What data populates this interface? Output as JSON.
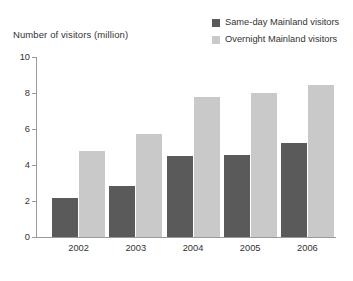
{
  "chart_data": {
    "type": "bar",
    "title": "Number of visitors (million)",
    "xlabel": "",
    "ylabel": "Number of visitors (million)",
    "categories": [
      "2002",
      "2003",
      "2004",
      "2005",
      "2006"
    ],
    "series": [
      {
        "name": "Same-day Mainland visitors",
        "color": "#5a5a5a",
        "values": [
          2.15,
          2.85,
          4.5,
          4.55,
          5.2
        ]
      },
      {
        "name": "Overnight Mainland visitors",
        "color": "#c9c9c9",
        "values": [
          4.8,
          5.7,
          7.8,
          8.0,
          8.45
        ]
      }
    ],
    "ylim": [
      0,
      10
    ],
    "yticks": [
      "0",
      "2",
      "4",
      "6",
      "8",
      "10"
    ],
    "grid": false,
    "legend_position": "top-right"
  },
  "legend": {
    "items": [
      {
        "label": "Same-day Mainland visitors",
        "swatch": "#5a5a5a"
      },
      {
        "label": "Overnight Mainland visitors",
        "swatch": "#c9c9c9"
      }
    ]
  }
}
